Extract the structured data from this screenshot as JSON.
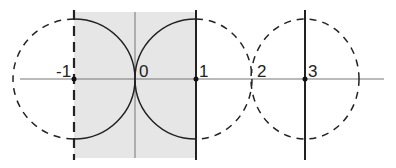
{
  "diagram": {
    "axis_labels": [
      "-1",
      "0",
      "1",
      "2",
      "3"
    ],
    "colors": {
      "shade": "#e6e6e6",
      "stroke": "#222222",
      "axis": "#777777"
    }
  }
}
